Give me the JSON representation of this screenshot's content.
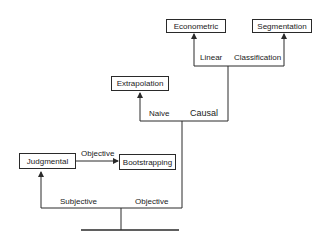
{
  "diagram": {
    "type": "tree",
    "nodes": {
      "econometric": "Econometric",
      "segmentation": "Segmentation",
      "extrapolation": "Extrapolation",
      "judgmental": "Judgmental",
      "bootstrapping": "Bootstrapping"
    },
    "edge_labels": {
      "linear": "Linear",
      "classification": "Classification",
      "naive": "Naive",
      "causal": "Causal",
      "objective_top": "Objective",
      "subjective": "Subjective",
      "objective_bottom": "Objective"
    },
    "edges": [
      {
        "from": "root",
        "to": "judgmental",
        "label": "Subjective"
      },
      {
        "from": "root",
        "to": "objective-branch",
        "label": "Objective"
      },
      {
        "from": "judgmental",
        "to": "bootstrapping",
        "label": "Objective"
      },
      {
        "from": "objective-branch",
        "to": "extrapolation",
        "label": "Naive"
      },
      {
        "from": "objective-branch",
        "to": "causal-branch",
        "label": "Causal"
      },
      {
        "from": "causal-branch",
        "to": "econometric",
        "label": "Linear"
      },
      {
        "from": "causal-branch",
        "to": "segmentation",
        "label": "Classification"
      }
    ],
    "colors": {
      "line": "#2a2a2a",
      "background": "#ffffff"
    }
  }
}
